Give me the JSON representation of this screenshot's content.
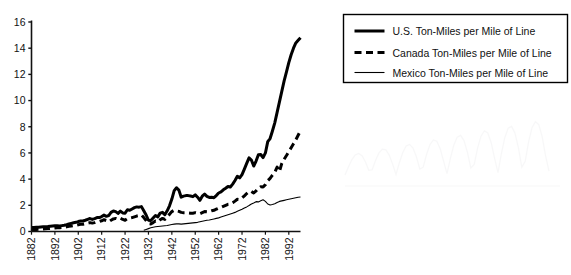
{
  "chart_data": {
    "type": "line",
    "title": "",
    "subtitle": "",
    "xlabel": "",
    "ylabel": "",
    "xlim": [
      1882,
      1997
    ],
    "ylim": [
      0,
      16
    ],
    "grid": false,
    "legend_position": "top-right",
    "y_ticks": [
      0,
      2,
      4,
      6,
      8,
      10,
      12,
      14,
      16
    ],
    "y_tick_labels": [
      "0",
      "2",
      "4",
      "6",
      "8",
      "10",
      "12",
      "14",
      "16"
    ],
    "x_ticks": [
      1882,
      1892,
      1902,
      1912,
      1922,
      1932,
      1942,
      1952,
      1962,
      1972,
      1982,
      1992
    ],
    "x_tick_labels": [
      "1882",
      "1892",
      "1902",
      "1912",
      "1922",
      "1932",
      "1942",
      "1952",
      "1962",
      "1972",
      "1982",
      "1992"
    ],
    "x_tick_rotation": 90,
    "series": [
      {
        "name": "U.S. Ton-Miles per Mile of Line",
        "style": "solid",
        "line_width": 3.0,
        "color": "#000000",
        "x_start": 1882,
        "values": [
          0.3,
          0.31,
          0.32,
          0.32,
          0.34,
          0.36,
          0.37,
          0.38,
          0.4,
          0.42,
          0.44,
          0.43,
          0.42,
          0.45,
          0.48,
          0.52,
          0.57,
          0.62,
          0.67,
          0.7,
          0.76,
          0.8,
          0.8,
          0.86,
          0.93,
          0.99,
          0.92,
          0.98,
          1.06,
          1.06,
          1.14,
          1.25,
          1.16,
          1.22,
          1.46,
          1.57,
          1.52,
          1.38,
          1.56,
          1.42,
          1.4,
          1.66,
          1.62,
          1.72,
          1.82,
          1.88,
          1.86,
          1.9,
          1.58,
          1.26,
          0.86,
          0.84,
          1.03,
          1.22,
          1.12,
          1.4,
          1.46,
          1.28,
          1.58,
          1.96,
          2.48,
          3.12,
          3.34,
          3.16,
          2.62,
          2.7,
          2.74,
          2.74,
          2.71,
          2.66,
          2.8,
          2.62,
          2.38,
          2.7,
          2.86,
          2.68,
          2.6,
          2.62,
          2.58,
          2.74,
          2.94,
          3.02,
          3.18,
          3.3,
          3.44,
          3.4,
          3.62,
          3.9,
          4.22,
          4.1,
          4.34,
          4.76,
          5.2,
          5.62,
          5.46,
          5.0,
          5.38,
          5.86,
          5.88,
          5.64,
          6.0,
          6.86,
          7.1,
          7.68,
          8.3,
          9.1,
          9.9,
          10.7,
          11.5,
          12.2,
          12.9,
          13.5,
          14.0,
          14.4,
          14.6,
          14.8
        ]
      },
      {
        "name": "Canada Ton-Miles per Mile of Line",
        "style": "dashed",
        "line_width": 3.0,
        "color": "#000000",
        "x_start": 1882,
        "values": [
          0.14,
          0.15,
          0.16,
          0.17,
          0.18,
          0.19,
          0.21,
          0.22,
          0.24,
          0.25,
          0.27,
          0.28,
          0.28,
          0.3,
          0.33,
          0.36,
          0.39,
          0.42,
          0.45,
          0.48,
          0.52,
          0.55,
          0.56,
          0.6,
          0.64,
          0.68,
          0.64,
          0.68,
          0.74,
          0.76,
          0.82,
          0.9,
          0.84,
          0.74,
          0.86,
          0.96,
          1.0,
          0.94,
          1.02,
          0.92,
          0.86,
          0.98,
          1.02,
          1.06,
          1.12,
          1.18,
          1.22,
          1.26,
          1.06,
          0.84,
          0.6,
          0.58,
          0.68,
          0.8,
          0.74,
          0.9,
          1.0,
          0.92,
          1.1,
          1.32,
          1.52,
          1.62,
          1.58,
          1.54,
          1.46,
          1.44,
          1.44,
          1.42,
          1.4,
          1.4,
          1.44,
          1.4,
          1.36,
          1.44,
          1.52,
          1.5,
          1.52,
          1.58,
          1.62,
          1.7,
          1.78,
          1.84,
          1.92,
          2.0,
          2.08,
          2.1,
          2.2,
          2.32,
          2.46,
          2.44,
          2.56,
          2.72,
          2.9,
          3.06,
          3.06,
          2.94,
          3.1,
          3.3,
          3.42,
          3.4,
          3.58,
          3.88,
          4.06,
          4.3,
          4.52,
          4.92,
          4.58,
          5.2,
          5.52,
          5.8,
          6.1,
          6.4,
          6.7,
          7.0,
          7.35,
          7.7
        ]
      },
      {
        "name": "Mexico Ton-Miles per Mile of Line",
        "style": "thin-solid",
        "line_width": 1.1,
        "color": "#000000",
        "x_start": 1930,
        "values": [
          0.1,
          0.16,
          0.22,
          0.28,
          0.32,
          0.36,
          0.38,
          0.4,
          0.42,
          0.44,
          0.46,
          0.5,
          0.54,
          0.56,
          0.58,
          0.58,
          0.56,
          0.58,
          0.6,
          0.62,
          0.64,
          0.66,
          0.68,
          0.7,
          0.74,
          0.78,
          0.82,
          0.86,
          0.88,
          0.92,
          0.96,
          1.0,
          1.04,
          1.1,
          1.16,
          1.22,
          1.28,
          1.34,
          1.4,
          1.46,
          1.54,
          1.62,
          1.7,
          1.8,
          1.88,
          1.98,
          2.1,
          2.18,
          2.28,
          2.26,
          2.34,
          2.42,
          2.3,
          2.1,
          2.02,
          2.06,
          2.12,
          2.22,
          2.3,
          2.34,
          2.38,
          2.42,
          2.46,
          2.5,
          2.54,
          2.58,
          2.62,
          2.64
        ]
      }
    ]
  },
  "legend": {
    "items": [
      {
        "label": "U.S. Ton-Miles per Mile of Line",
        "style": "solid"
      },
      {
        "label": "Canada Ton-Miles per Mile of Line",
        "style": "dashed"
      },
      {
        "label": "Mexico Ton-Miles per Mile of Line",
        "style": "thin-solid"
      }
    ]
  },
  "colors": {
    "ink": "#000000",
    "background": "#ffffff"
  }
}
